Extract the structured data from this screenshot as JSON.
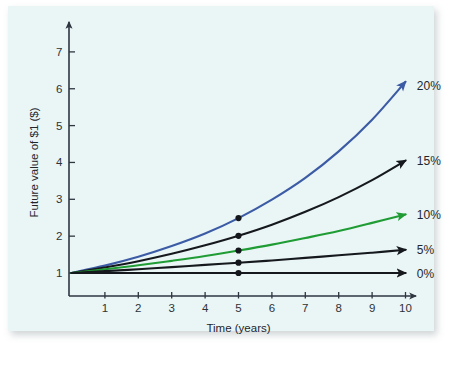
{
  "figure": {
    "background_color": "#ffffff",
    "panel_color": "#eaf5f6"
  },
  "chart_data": {
    "type": "line",
    "title": "",
    "xlabel": "Time (years)",
    "ylabel": "Future value of $1 ($)",
    "xlim": [
      0,
      10.6
    ],
    "ylim": [
      0,
      7.6
    ],
    "xticks": [
      "1",
      "2",
      "3",
      "4",
      "5",
      "6",
      "7",
      "8",
      "9",
      "10"
    ],
    "xtick_values": [
      1,
      2,
      3,
      4,
      5,
      6,
      7,
      8,
      9,
      10
    ],
    "yticks": [
      "1",
      "2",
      "3",
      "4",
      "5",
      "6",
      "7"
    ],
    "ytick_values": [
      1,
      2,
      3,
      4,
      5,
      6,
      7
    ],
    "grid": false,
    "legend_position": "right-of-line-ends",
    "x": [
      0,
      1,
      2,
      3,
      4,
      5,
      6,
      7,
      8,
      9,
      10
    ],
    "series": [
      {
        "name": "20%",
        "rate": 0.2,
        "color": "#3b5ba5",
        "label": "20%",
        "label_x": 10.25,
        "label_y": 6.1,
        "arrow": true,
        "marker_year": 5,
        "marker_value": 2.49,
        "values": [
          1,
          1.2,
          1.44,
          1.73,
          2.07,
          2.49,
          2.99,
          3.58,
          4.3,
          5.16,
          6.19
        ]
      },
      {
        "name": "15%",
        "rate": 0.15,
        "color": "#15191d",
        "label": "15%",
        "label_x": 10.25,
        "label_y": 4.05,
        "arrow": true,
        "marker_year": 5,
        "marker_value": 2.01,
        "values": [
          1,
          1.15,
          1.32,
          1.52,
          1.75,
          2.01,
          2.31,
          2.66,
          3.06,
          3.52,
          4.05
        ]
      },
      {
        "name": "10%",
        "rate": 0.1,
        "color": "#1f9c34",
        "label": "10%",
        "label_x": 10.25,
        "label_y": 2.59,
        "arrow": true,
        "marker_year": 5,
        "marker_value": 1.61,
        "values": [
          1,
          1.1,
          1.21,
          1.33,
          1.46,
          1.61,
          1.77,
          1.95,
          2.14,
          2.36,
          2.59
        ]
      },
      {
        "name": "5%",
        "rate": 0.05,
        "color": "#15191d",
        "label": "5%",
        "label_x": 10.25,
        "label_y": 1.63,
        "arrow": true,
        "marker_year": 5,
        "marker_value": 1.28,
        "values": [
          1,
          1.05,
          1.1,
          1.16,
          1.22,
          1.28,
          1.34,
          1.41,
          1.48,
          1.55,
          1.63
        ]
      },
      {
        "name": "0%",
        "rate": 0.0,
        "color": "#15191d",
        "label": "0%",
        "label_x": 10.25,
        "label_y": 1.0,
        "arrow": true,
        "marker_year": 5,
        "marker_value": 1.0,
        "values": [
          1,
          1,
          1,
          1,
          1,
          1,
          1,
          1,
          1,
          1,
          1
        ]
      }
    ]
  }
}
